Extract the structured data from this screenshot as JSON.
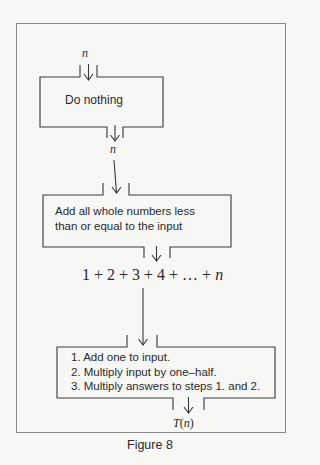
{
  "figure": {
    "caption": "Figure 8"
  },
  "flow": {
    "input_label": "n",
    "box1": {
      "text": "Do nothing"
    },
    "middle_label": "n",
    "box2": {
      "line1": "Add all whole numbers less",
      "line2": "than or equal to the input"
    },
    "expression": "1 + 2 + 3 + 4 + … + n",
    "expression_parts": {
      "prefix": "1 + 2 + 3 + 4 + … + ",
      "var": "n"
    },
    "box3": {
      "steps": [
        "1. Add one to input.",
        "2. Multiply input by one–half.",
        "3. Multiply answers to steps 1. and 2."
      ]
    },
    "output_label": {
      "fn": "T(",
      "var": "n",
      "close": ")"
    }
  },
  "colors": {
    "line": "#4a4a4a",
    "frame": "#8a8a8a",
    "background": "#f7f7f5"
  }
}
